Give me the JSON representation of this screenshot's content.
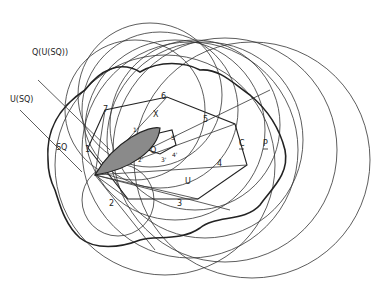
{
  "figure": {
    "colors": {
      "stroke": "#222222",
      "shade": "#8a8a8a",
      "background": "#ffffff"
    },
    "labels": {
      "q_u_sq": "Q(U(SQ))",
      "u_sq": "U(SQ)",
      "sq": "SQ",
      "x": "X",
      "o": "O",
      "u": "U",
      "c": "C",
      "p": "P",
      "v1": "1",
      "v2": "2",
      "v3": "3",
      "v4": "4",
      "v5": "5",
      "v6": "6",
      "v7": "7",
      "p1": "1'",
      "p2": "2'",
      "p3": "3'",
      "p4": "4'",
      "p5": "5'"
    }
  }
}
